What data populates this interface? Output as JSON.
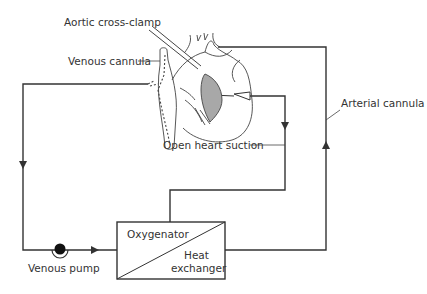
{
  "diagram": {
    "labels": {
      "aortic_cross_clamp": "Aortic cross-clamp",
      "venous_cannula": "Venous cannula",
      "arterial_cannula": "Arterial cannula",
      "open_heart_suction": "Open heart suction",
      "oxygenator": "Oxygenator",
      "heat": "Heat",
      "exchanger": "exchanger",
      "venous_pump": "Venous pump"
    },
    "colors": {
      "line": "#333333",
      "heart_fill_shaded": "#a8a8a8",
      "background": "#ffffff"
    }
  }
}
